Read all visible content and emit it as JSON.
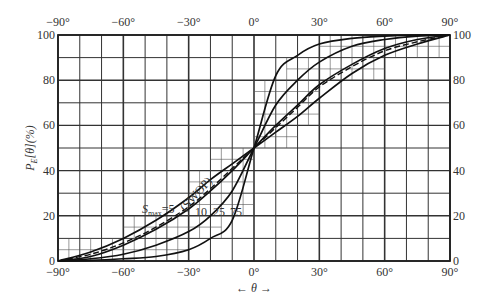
{
  "chart_data": {
    "type": "line",
    "title": "",
    "xlabel": "← θ →",
    "ylabel": "P_E[θ](%)",
    "xlim": [
      -90,
      90
    ],
    "ylim": [
      0,
      100
    ],
    "x_ticks": [
      "-90°",
      "-60°",
      "-30°",
      "0°",
      "30°",
      "60°",
      "90°"
    ],
    "y_ticks": [
      "0",
      "20",
      "40",
      "60",
      "80",
      "100"
    ],
    "grid": true,
    "x": [
      -90,
      -75,
      -60,
      -45,
      -30,
      -20,
      -10,
      0,
      10,
      20,
      30,
      45,
      60,
      75,
      90
    ],
    "series": [
      {
        "name": "S_max = 5",
        "style": "solid",
        "values": [
          0,
          4,
          10,
          18,
          28,
          36,
          43,
          50,
          57,
          64,
          72,
          83,
          91,
          96,
          100
        ]
      },
      {
        "name": "(SWOP)",
        "style": "dashed",
        "values": [
          0,
          3,
          8,
          15,
          24,
          32,
          41,
          50,
          59,
          68,
          77,
          86,
          93,
          97,
          100
        ]
      },
      {
        "name": "10",
        "style": "solid",
        "values": [
          0,
          2,
          7,
          14,
          23,
          31,
          40,
          50,
          60,
          69,
          78,
          87,
          94,
          98,
          100
        ]
      },
      {
        "name": "25",
        "style": "solid",
        "values": [
          0,
          1,
          3,
          7,
          13,
          20,
          31,
          50,
          69,
          80,
          88,
          95,
          98,
          99.5,
          100
        ]
      },
      {
        "name": "75",
        "style": "solid",
        "values": [
          0,
          0.3,
          1,
          2,
          5,
          10,
          18,
          50,
          82,
          91,
          96,
          98.5,
          99.5,
          100,
          100
        ]
      }
    ],
    "annotations": [
      "S_max = 5",
      "(SWOP)",
      "10",
      "25",
      "75"
    ]
  },
  "labels": {
    "ylabel_main": "P",
    "ylabel_sub": "E",
    "ylabel_rest": "[θ](%)",
    "xlabel": "←  θ  →",
    "smax_S": "S",
    "smax_sub": "max",
    "smax_eq": "=5",
    "swop": "(SWOP)",
    "l10": "10",
    "l25": "25",
    "l75": "75"
  }
}
